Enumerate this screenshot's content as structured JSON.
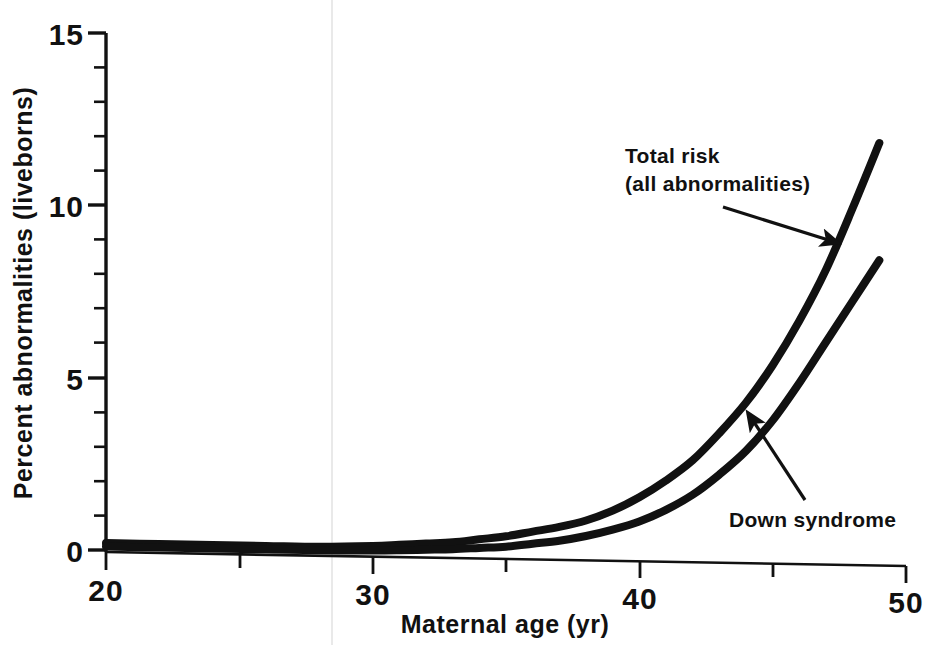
{
  "chart_data": {
    "type": "line",
    "title": "",
    "xlabel": "Maternal age (yr)",
    "ylabel": "Percent abnormalities (liveborns)",
    "xlim": [
      20,
      50
    ],
    "ylim": [
      0,
      15
    ],
    "x_major_ticks": [
      20,
      30,
      40,
      50
    ],
    "x_minor_ticks": [
      25,
      35,
      45
    ],
    "x_tick_labels": [
      "20",
      "30",
      "40",
      "50"
    ],
    "y_major_ticks": [
      0,
      5,
      10,
      15
    ],
    "y_tick_labels": [
      "0",
      "5",
      "10",
      "15"
    ],
    "y_minor_ticks": [
      1,
      2,
      3,
      4,
      6,
      7,
      8,
      9,
      11,
      12,
      13,
      14
    ],
    "grid": false,
    "legend": "none",
    "line_color": "#111111",
    "series": [
      {
        "name": "Total risk (all abnormalities)",
        "x": [
          20,
          22,
          24,
          26,
          28,
          30,
          31,
          32,
          33,
          34,
          35,
          36,
          37,
          38,
          39,
          40,
          41,
          42,
          43,
          44,
          45,
          46,
          47,
          48,
          49
        ],
        "values": [
          0.2,
          0.2,
          0.2,
          0.2,
          0.2,
          0.25,
          0.3,
          0.35,
          0.4,
          0.5,
          0.6,
          0.75,
          0.9,
          1.1,
          1.4,
          1.8,
          2.3,
          2.9,
          3.7,
          4.6,
          5.7,
          7.0,
          8.5,
          10.3,
          12.2
        ]
      },
      {
        "name": "Down syndrome",
        "x": [
          20,
          22,
          24,
          26,
          28,
          30,
          31,
          32,
          33,
          34,
          35,
          36,
          37,
          38,
          39,
          40,
          41,
          42,
          43,
          44,
          45,
          46,
          47,
          48,
          49
        ],
        "values": [
          0.1,
          0.1,
          0.1,
          0.1,
          0.1,
          0.12,
          0.14,
          0.17,
          0.2,
          0.25,
          0.3,
          0.4,
          0.5,
          0.65,
          0.85,
          1.1,
          1.45,
          1.9,
          2.5,
          3.2,
          4.1,
          5.2,
          6.4,
          7.6,
          8.8
        ]
      }
    ],
    "annotations": [
      {
        "name": "total-risk",
        "line1": "Total risk",
        "line2": "(all abnormalities)",
        "arrow_from": [
          750,
          215
        ],
        "arrow_to": [
          845,
          245
        ]
      },
      {
        "name": "down-syndrome",
        "line1": "Down syndrome",
        "arrow_from": [
          805,
          490
        ],
        "arrow_to": [
          748,
          412
        ]
      }
    ]
  },
  "axis": {
    "x_title": "Maternal age (yr)",
    "y_title": "Percent abnormalities (liveborns)"
  },
  "ticks": {
    "y": [
      "15",
      "10",
      "5",
      "0"
    ],
    "x": [
      "20",
      "30",
      "40",
      "50"
    ]
  },
  "annotations": {
    "total_risk_line1": "Total risk",
    "total_risk_line2": "(all abnormalities)",
    "down_syndrome": "Down syndrome"
  },
  "colors": {
    "ink": "#111111",
    "background": "#ffffff",
    "fold_line": "#e8e8e8"
  }
}
